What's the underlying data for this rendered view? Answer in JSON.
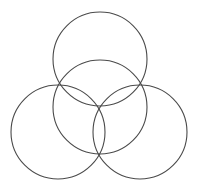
{
  "diagram": {
    "type": "overlapping-circles",
    "background": "#ffffff",
    "stroke_color": "#4a4a4a",
    "stroke_width": 1.1,
    "circles": [
      {
        "name": "top-circle",
        "cx": 100,
        "cy": 59,
        "r": 47
      },
      {
        "name": "center-circle",
        "cx": 100,
        "cy": 107,
        "r": 47
      },
      {
        "name": "left-circle",
        "cx": 58,
        "cy": 132,
        "r": 47
      },
      {
        "name": "right-circle",
        "cx": 140,
        "cy": 132,
        "r": 47
      }
    ]
  }
}
